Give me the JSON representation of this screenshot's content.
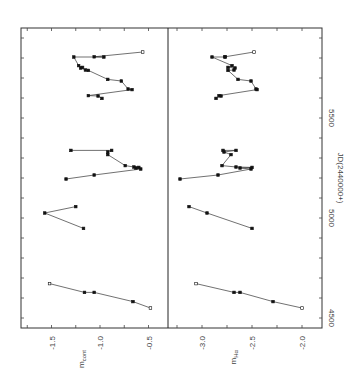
{
  "chart_data": {
    "type": "line",
    "orientation": "rotated 90 degrees counter-clockwise",
    "xlabel": "JD(2440000+)",
    "x_ticks": [
      "4500",
      "5000",
      "5500"
    ],
    "xlim": [
      4450,
      5950
    ],
    "panels": [
      {
        "name": "continuum",
        "ylabel": "m_cont",
        "ylabel_main": "m",
        "ylabel_sub": "cont",
        "y_ticks": [
          "-1.5",
          "-1.0",
          "-0.5"
        ],
        "ylim": [
          -1.8,
          -0.3
        ],
        "series": [
          {
            "name": "segment-1",
            "points": [
              [
                4550,
                -0.48
              ],
              [
                4582,
                -0.66
              ],
              [
                4628,
                -1.06
              ],
              [
                4628,
                -1.16
              ],
              [
                4672,
                -1.52
              ]
            ]
          },
          {
            "name": "segment-2",
            "points": [
              [
                4948,
                -1.17
              ],
              [
                5025,
                -1.57
              ],
              [
                5057,
                -1.25
              ]
            ]
          },
          {
            "name": "segment-3",
            "points": [
              [
                5195,
                -1.35
              ],
              [
                5215,
                -1.06
              ],
              [
                5245,
                -0.58
              ],
              [
                5250,
                -0.63
              ],
              [
                5253,
                -0.6
              ],
              [
                5255,
                -0.65
              ],
              [
                5262,
                -0.74
              ],
              [
                5317,
                -0.92
              ],
              [
                5330,
                -0.92
              ],
              [
                5338,
                -0.88
              ],
              [
                5338,
                -1.3
              ]
            ]
          },
          {
            "name": "segment-4",
            "points": [
              [
                5598,
                -0.98
              ],
              [
                5610,
                -1.02
              ],
              [
                5612,
                -1.12
              ],
              [
                5642,
                -0.67
              ],
              [
                5645,
                -0.71
              ],
              [
                5685,
                -0.78
              ],
              [
                5693,
                -0.92
              ],
              [
                5738,
                -1.12
              ],
              [
                5740,
                -1.15
              ],
              [
                5750,
                -1.2
              ],
              [
                5753,
                -1.18
              ],
              [
                5762,
                -1.22
              ],
              [
                5805,
                -1.27
              ],
              [
                5805,
                -0.96
              ],
              [
                5806,
                -1.06
              ],
              [
                5830,
                -0.56
              ]
            ]
          }
        ]
      },
      {
        "name": "halpha",
        "ylabel": "m_Ha",
        "ylabel_main": "m",
        "ylabel_sub": "Hα",
        "y_ticks": [
          "-3.0",
          "-2.5",
          "-2.0"
        ],
        "ylim": [
          -3.35,
          -1.85
        ],
        "series": [
          {
            "name": "segment-1",
            "points": [
              [
                4550,
                -2.0
              ],
              [
                4582,
                -2.29
              ],
              [
                4628,
                -2.62
              ],
              [
                4628,
                -2.68
              ],
              [
                4672,
                -3.06
              ]
            ]
          },
          {
            "name": "segment-2",
            "points": [
              [
                4948,
                -2.5
              ],
              [
                5025,
                -2.95
              ],
              [
                5057,
                -3.13
              ]
            ]
          },
          {
            "name": "segment-3",
            "points": [
              [
                5195,
                -3.22
              ],
              [
                5215,
                -2.84
              ],
              [
                5245,
                -2.51
              ],
              [
                5250,
                -2.62
              ],
              [
                5253,
                -2.5
              ],
              [
                5255,
                -2.66
              ],
              [
                5262,
                -2.8
              ],
              [
                5317,
                -2.71
              ],
              [
                5330,
                -2.78
              ],
              [
                5338,
                -2.66
              ],
              [
                5338,
                -2.79
              ]
            ]
          },
          {
            "name": "segment-4",
            "points": [
              [
                5598,
                -2.86
              ],
              [
                5610,
                -2.81
              ],
              [
                5612,
                -2.83
              ],
              [
                5642,
                -2.45
              ],
              [
                5645,
                -2.46
              ],
              [
                5685,
                -2.51
              ],
              [
                5693,
                -2.64
              ],
              [
                5738,
                -2.74
              ],
              [
                5740,
                -2.68
              ],
              [
                5750,
                -2.67
              ],
              [
                5753,
                -2.74
              ],
              [
                5762,
                -2.7
              ],
              [
                5805,
                -2.9
              ],
              [
                5805,
                -2.77
              ],
              [
                5806,
                -2.77
              ],
              [
                5830,
                -2.48
              ]
            ]
          }
        ]
      }
    ],
    "grid": false,
    "legend": null
  }
}
